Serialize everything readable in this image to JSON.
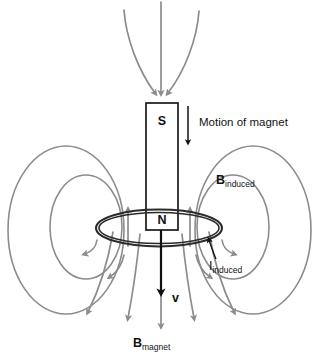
{
  "figure": {
    "colors": {
      "field_line": "#8c8c8c",
      "magnet_outline": "#1a1a1a",
      "ring": "#2b2b2b",
      "text": "#121212",
      "background": "#ffffff"
    }
  },
  "magnet": {
    "top_pole_label": "S",
    "bottom_pole_label": "N"
  },
  "labels": {
    "motion": "Motion of magnet",
    "b_induced": {
      "symbol": "B",
      "subscript": "induced"
    },
    "i_induced": {
      "symbol": "I",
      "subscript": "induced"
    },
    "b_magnet": {
      "symbol": "B",
      "subscript": "magnet"
    },
    "velocity": "v"
  },
  "icons": {
    "motion_arrow": "down-arrow-icon",
    "velocity_arrow": "down-arrow-icon",
    "field_arrow": "arrowhead-icon",
    "leader_arrow": "leader-arrow-icon"
  }
}
